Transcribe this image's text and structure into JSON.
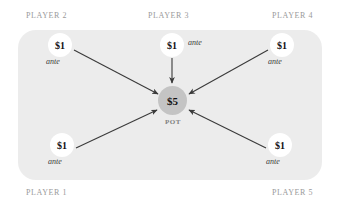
{
  "figure": {
    "pot": {
      "amount": "$5",
      "label": "POT"
    },
    "colors": {
      "panel": "#ececec",
      "pot_chip": "#c4c4c4",
      "player_label": "#9a9a9a",
      "arrow": "#3a3a3a",
      "chip_face": "#ffffff",
      "amount_text": "#111111"
    },
    "players": [
      {
        "id": "player-1",
        "name": "PLAYER 1",
        "amount": "$1",
        "note": "ante",
        "corner": "bottom-left"
      },
      {
        "id": "player-2",
        "name": "PLAYER 2",
        "amount": "$1",
        "note": "ante",
        "corner": "top-left"
      },
      {
        "id": "player-3",
        "name": "PLAYER 3",
        "amount": "$1",
        "note": "ante",
        "corner": "top-center"
      },
      {
        "id": "player-4",
        "name": "PLAYER 4",
        "amount": "$1",
        "note": "ante",
        "corner": "top-right"
      },
      {
        "id": "player-5",
        "name": "PLAYER 5",
        "amount": "$1",
        "note": "ante",
        "corner": "bottom-right"
      }
    ]
  }
}
